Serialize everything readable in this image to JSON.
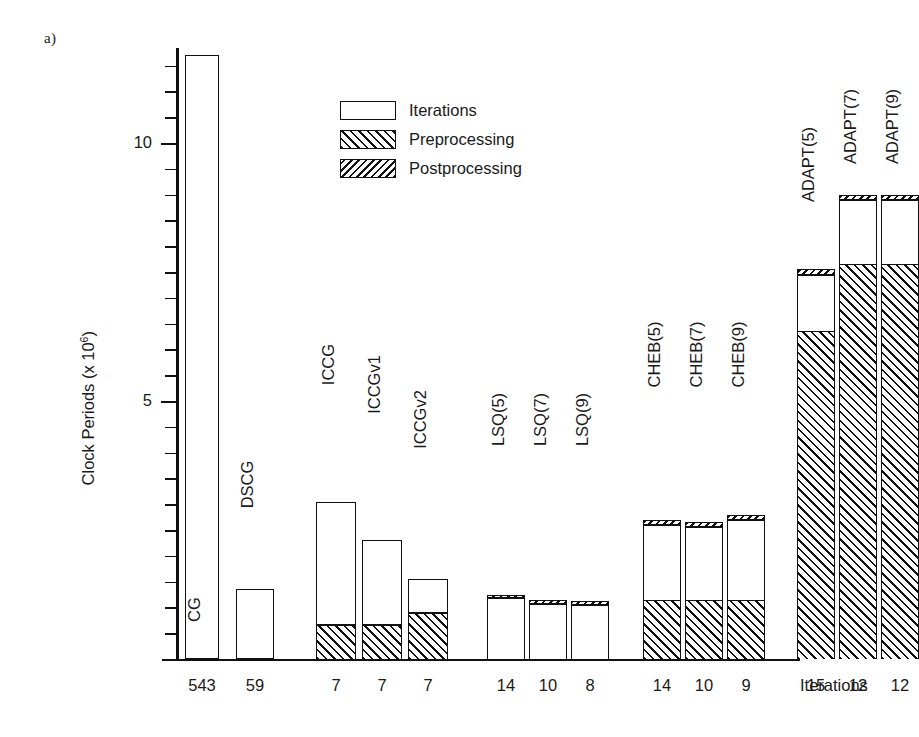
{
  "panel_tag": "a)",
  "legend": {
    "position": "inside-top-center",
    "items": [
      {
        "label": "Iterations",
        "pattern": "empty"
      },
      {
        "label": "Preprocessing",
        "pattern": "forward-hatch"
      },
      {
        "label": "Postprocessing",
        "pattern": "back-hatch"
      }
    ]
  },
  "x_axis_caption": "Iterations",
  "chart_data": {
    "type": "bar",
    "subtype": "stacked-vertical",
    "title": "",
    "xlabel": "Iterations",
    "ylabel": "Clock Periods (x 10⁶)",
    "ylabel_base": "Clock Periods (x 10",
    "ylabel_exp": "6",
    "ylabel_tail": ")",
    "ylim": [
      0,
      12.4
    ],
    "ytick_labels": [
      "5",
      "10"
    ],
    "ytick_values": [
      5,
      10
    ],
    "minor_tick_step": 0.5,
    "grid": false,
    "categories": [
      "CG",
      "DSCG",
      "ICCG",
      "ICCGv1",
      "ICCGv2",
      "LSQ(5)",
      "LSQ(7)",
      "LSQ(9)",
      "CHEB(5)",
      "CHEB(7)",
      "CHEB(9)",
      "ADAPT(5)",
      "ADAPT(7)",
      "ADAPT(9)"
    ],
    "iteration_counts": [
      543,
      59,
      7,
      7,
      7,
      14,
      10,
      8,
      14,
      10,
      9,
      15,
      12,
      12
    ],
    "series": [
      {
        "name": "Preprocessing",
        "values": [
          0,
          0,
          0.65,
          0.65,
          0.9,
          0,
          0,
          0,
          1.15,
          1.15,
          1.15,
          6.35,
          7.65,
          7.65
        ]
      },
      {
        "name": "Iterations",
        "values": [
          11.7,
          1.35,
          2.4,
          1.65,
          0.65,
          1.18,
          1.08,
          1.05,
          1.45,
          1.4,
          1.55,
          1.1,
          1.25,
          1.25
        ]
      },
      {
        "name": "Postprocessing",
        "values": [
          0,
          0,
          0,
          0,
          0,
          0.07,
          0.07,
          0.07,
          0.1,
          0.1,
          0.1,
          0.1,
          0.1,
          0.1
        ]
      }
    ],
    "totals": [
      11.7,
      1.35,
      3.05,
      2.3,
      1.55,
      1.25,
      1.15,
      1.12,
      2.7,
      2.65,
      2.8,
      7.55,
      9.0,
      9.0
    ]
  },
  "layout": {
    "bar_x_centers": [
      26,
      79,
      160,
      206,
      252,
      330,
      372,
      414,
      486,
      528,
      570,
      640,
      682,
      724
    ],
    "bar_widths": [
      34,
      38,
      40,
      40,
      40,
      38,
      38,
      38,
      38,
      38,
      38,
      38,
      38,
      38
    ],
    "label_tops": [
      545,
      420,
      300,
      320,
      355,
      355,
      355,
      355,
      290,
      290,
      290,
      100,
      62,
      62
    ]
  }
}
